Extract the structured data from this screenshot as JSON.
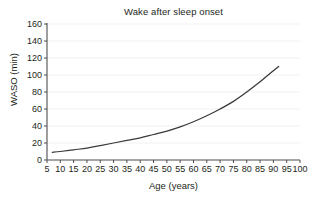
{
  "chart_data": {
    "type": "line",
    "title": "Wake after sleep onset",
    "xlabel": "Age (years)",
    "ylabel": "WASO (min)",
    "xlim": [
      5,
      100
    ],
    "ylim": [
      0,
      160
    ],
    "grid": "horizontal",
    "legend": null,
    "line_color": "#3a3a3a",
    "x_ticks": [
      5,
      10,
      15,
      20,
      25,
      30,
      35,
      40,
      45,
      50,
      55,
      60,
      65,
      70,
      75,
      80,
      85,
      90,
      95,
      100
    ],
    "y_ticks": [
      0,
      20,
      40,
      60,
      80,
      100,
      120,
      140,
      160
    ],
    "series": [
      {
        "name": "WASO",
        "x": [
          7,
          10,
          15,
          20,
          25,
          30,
          35,
          40,
          45,
          50,
          55,
          60,
          65,
          70,
          75,
          80,
          85,
          90,
          92
        ],
        "values": [
          9,
          10,
          12,
          14,
          17,
          20,
          23,
          26,
          30,
          34,
          39,
          45,
          52,
          60,
          69,
          80,
          92,
          105,
          110
        ]
      }
    ]
  }
}
